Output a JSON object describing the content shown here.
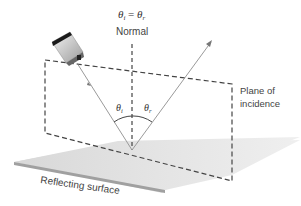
{
  "diagram": {
    "title_equation": {
      "left": "θ",
      "left_sub": "i",
      "equals": " = ",
      "right": "θ",
      "right_sub": "r"
    },
    "normal_label": "Normal",
    "plane_label_line1": "Plane of",
    "plane_label_line2": "incidence",
    "surface_label": "Reflecting surface",
    "angle_incidence": {
      "symbol": "θ",
      "sub": "i"
    },
    "angle_reflection": {
      "symbol": "θ",
      "sub": "r"
    },
    "colors": {
      "surface_top": "#e2e2e2",
      "surface_edge": "#9a9a9a",
      "ray": "#9a9a9a",
      "dashed": "#444444",
      "text": "#444444"
    }
  }
}
